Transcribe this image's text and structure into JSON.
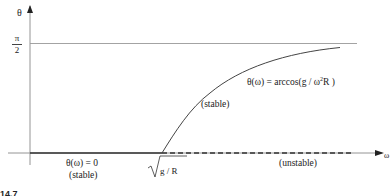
{
  "diagram": {
    "y_axis_label": "θ",
    "x_axis_label": "ω",
    "y_tick": {
      "numerator": "π",
      "denominator": "2"
    },
    "x_tick": {
      "radicand": "g / R"
    },
    "curve_label_formula": "θ(ω) =  arccos(g / ω",
    "curve_label_exponent": "2",
    "curve_label_tail": "R )",
    "upper_branch_label": "(stable)",
    "zero_branch_formula": "θ(ω) = 0",
    "zero_branch_label": "(stable)",
    "unstable_branch_label": "(unstable)",
    "figure_fragment": "14.7",
    "colors": {
      "axis": "#888888",
      "curve": "#444444",
      "asymptote": "#999999",
      "text": "#222222"
    }
  }
}
